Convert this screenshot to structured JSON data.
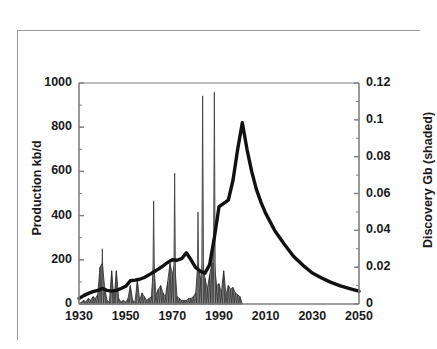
{
  "figure": {
    "title": "Colombia",
    "background_color": "#ffffff",
    "border_color": "#9a9a9a"
  },
  "chart_data": {
    "type": "area",
    "title": "Colombia",
    "xlabel": "",
    "ylabel": "Production kb/d",
    "y2label": "Discovery Gb (shaded)",
    "xlim": [
      1930,
      2050
    ],
    "ylim": [
      0,
      1000
    ],
    "y2lim": [
      0,
      0.12
    ],
    "grid": false,
    "legend": "none",
    "xticks": [
      "1930",
      "1950",
      "1970",
      "1990",
      "2010",
      "2030",
      "2050"
    ],
    "xtick_values": [
      1930,
      1950,
      1970,
      1990,
      2010,
      2030,
      2050
    ],
    "yticks_left": [
      "0",
      "200",
      "400",
      "600",
      "800",
      "1000"
    ],
    "ytick_left_values": [
      0,
      200,
      400,
      600,
      800,
      1000
    ],
    "yticks_right": [
      "0",
      "0.02",
      "0.04",
      "0.06",
      "0.08",
      "0.1",
      "0.12"
    ],
    "ytick_right_values": [
      0,
      0.02,
      0.04,
      0.06,
      0.08,
      0.1,
      0.12
    ],
    "minor_tick_count_left": 10,
    "minor_tick_count_right": 12,
    "line_color": "#111111",
    "fill_color": "#8f8f8f",
    "fill_edge_color": "#2b2b2b",
    "series": [
      {
        "name": "Production kb/d",
        "type": "line",
        "axis": "left",
        "color": "#111111",
        "x": [
          1930,
          1932,
          1934,
          1936,
          1938,
          1940,
          1942,
          1944,
          1946,
          1948,
          1950,
          1952,
          1954,
          1956,
          1958,
          1960,
          1962,
          1964,
          1966,
          1968,
          1970,
          1972,
          1974,
          1976,
          1978,
          1980,
          1982,
          1984,
          1986,
          1988,
          1990,
          1992,
          1994,
          1996,
          1998,
          2000,
          2002,
          2004,
          2006,
          2008,
          2010,
          2014,
          2018,
          2022,
          2026,
          2030,
          2034,
          2038,
          2042,
          2046,
          2050
        ],
        "y": [
          25,
          38,
          48,
          56,
          62,
          70,
          62,
          58,
          62,
          70,
          80,
          105,
          108,
          112,
          120,
          132,
          145,
          158,
          172,
          188,
          200,
          198,
          205,
          232,
          200,
          165,
          148,
          140,
          178,
          300,
          440,
          455,
          470,
          560,
          700,
          820,
          700,
          600,
          520,
          460,
          410,
          330,
          270,
          215,
          175,
          140,
          118,
          98,
          82,
          70,
          58
        ]
      },
      {
        "name": "Discovery Gb (shaded)",
        "type": "area-spikes",
        "axis": "right",
        "color": "#8f8f8f",
        "x": [
          1930,
          1931,
          1932,
          1933,
          1934,
          1935,
          1936,
          1937,
          1938,
          1939,
          1940,
          1941,
          1942,
          1943,
          1944,
          1945,
          1946,
          1947,
          1948,
          1949,
          1950,
          1951,
          1952,
          1953,
          1954,
          1955,
          1956,
          1957,
          1958,
          1959,
          1960,
          1961,
          1962,
          1963,
          1964,
          1965,
          1966,
          1967,
          1968,
          1969,
          1970,
          1971,
          1972,
          1973,
          1974,
          1975,
          1976,
          1977,
          1978,
          1979,
          1980,
          1981,
          1982,
          1983,
          1984,
          1985,
          1986,
          1987,
          1988,
          1989,
          1990,
          1991,
          1992,
          1993,
          1994,
          1995,
          1996,
          1997,
          1998,
          1999,
          2000
        ],
        "y": [
          0.0,
          0.001,
          0.002,
          0.001,
          0.003,
          0.002,
          0.004,
          0.003,
          0.005,
          0.02,
          0.03,
          0.009,
          0.002,
          0.001,
          0.018,
          0.002,
          0.018,
          0.003,
          0.001,
          0.002,
          0.001,
          0.003,
          0.01,
          0.002,
          0.001,
          0.013,
          0.002,
          0.006,
          0.004,
          0.002,
          0.003,
          0.004,
          0.056,
          0.005,
          0.008,
          0.01,
          0.006,
          0.004,
          0.012,
          0.022,
          0.016,
          0.071,
          0.004,
          0.003,
          0.002,
          0.002,
          0.002,
          0.003,
          0.003,
          0.004,
          0.006,
          0.05,
          0.013,
          0.113,
          0.014,
          0.008,
          0.016,
          0.03,
          0.115,
          0.01,
          0.011,
          0.006,
          0.018,
          0.005,
          0.01,
          0.008,
          0.009,
          0.006,
          0.005,
          0.004,
          0.0
        ],
        "notes": "Discovery is plotted as narrow annual spikes with a filled (shaded) envelope; largest discoveries ~0.113 Gb (1983) and ~0.115 Gb (1988)."
      }
    ]
  }
}
